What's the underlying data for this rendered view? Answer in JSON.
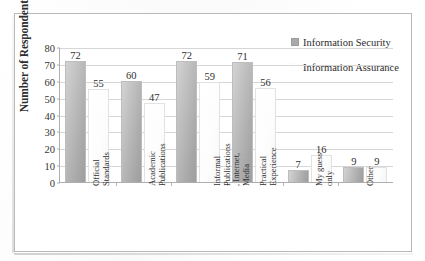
{
  "chart_data": {
    "type": "bar",
    "title": "",
    "xlabel": "",
    "ylabel": "Number of Respondents",
    "ylim": [
      0,
      80
    ],
    "ytick_step": 10,
    "yticks": [
      80,
      70,
      60,
      50,
      40,
      30,
      20,
      10,
      0
    ],
    "grid": true,
    "legend_position": "top-right",
    "categories": [
      "Official Standards",
      "Academic Publications",
      "Informal Publications, Internet, Media",
      "Practical Experience",
      "My guess only",
      "Other"
    ],
    "category_label_lines": [
      [
        "Official",
        "Standards"
      ],
      [
        "Academic",
        "Publications"
      ],
      [
        "Informal",
        "Publications",
        ", Internet,",
        "Media"
      ],
      [
        "Practical",
        "Experience"
      ],
      [
        "My guess",
        "only"
      ],
      [
        "Other"
      ]
    ],
    "series": [
      {
        "name": "Information Security",
        "color": "#a9a9a9",
        "values": [
          72,
          60,
          72,
          71,
          7,
          9
        ]
      },
      {
        "name": "Information Assurance",
        "color": "#ffffff",
        "values": [
          55,
          47,
          59,
          56,
          16,
          9
        ]
      }
    ]
  },
  "legend": {
    "items": [
      {
        "label": "Information Security",
        "swatch": "legend-swatch-security"
      },
      {
        "label": "Information Assurance",
        "swatch": "legend-swatch-assurance"
      }
    ]
  },
  "axis": {
    "y_title": "Number of Respondents"
  }
}
